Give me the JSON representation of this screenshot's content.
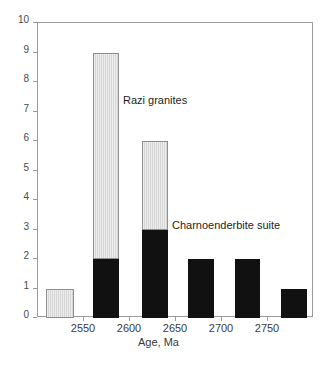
{
  "chart_data": {
    "type": "bar",
    "title": "",
    "subtitle": "",
    "xlabel": "Age, Ma",
    "ylabel": "",
    "xlim": [
      2500,
      2800
    ],
    "ylim": [
      0,
      10
    ],
    "grid": false,
    "legend_position": "none",
    "stacked": true,
    "x_ticks": [
      2550,
      2600,
      2650,
      2700,
      2750
    ],
    "x_tick_labels": [
      "2550",
      "2600",
      "2650",
      "2700",
      "2750"
    ],
    "y_ticks": [
      0,
      1,
      2,
      3,
      4,
      5,
      6,
      7,
      8,
      9,
      10
    ],
    "y_tick_labels": [
      "0",
      "1",
      "2",
      "3",
      "4",
      "5",
      "6",
      "7",
      "8",
      "9",
      "10"
    ],
    "bin_width": 25,
    "categories": [
      "2525",
      "2575",
      "2625",
      "2675",
      "2725",
      "2775"
    ],
    "series": [
      {
        "name": "Charnoenderbite suite",
        "color": "#111111",
        "values": [
          0,
          2,
          3,
          2,
          2,
          1
        ]
      },
      {
        "name": "Razi granites",
        "color": "#d6d6d6",
        "values": [
          1,
          7,
          3,
          0,
          0,
          0
        ]
      }
    ],
    "totals": [
      1,
      9,
      6,
      2,
      2,
      1
    ],
    "annotations": [
      {
        "text": "Razi granites",
        "x": 2585,
        "y": 7.6
      },
      {
        "text": "Charnoenderbite suite",
        "x": 2678,
        "y": 3.35
      }
    ],
    "bars": [
      {
        "center": 2525,
        "left_px": 45,
        "width_px": 28,
        "dark": 0,
        "light": 1,
        "total": 1
      },
      {
        "center": 2575,
        "left_px": 92,
        "width_px": 26,
        "dark": 2,
        "light": 7,
        "total": 9
      },
      {
        "center": 2625,
        "left_px": 141,
        "width_px": 26,
        "dark": 3,
        "light": 3,
        "total": 6
      },
      {
        "center": 2675,
        "left_px": 187,
        "width_px": 26,
        "dark": 2,
        "light": 0,
        "total": 2
      },
      {
        "center": 2725,
        "left_px": 234,
        "width_px": 25,
        "dark": 2,
        "light": 0,
        "total": 2
      },
      {
        "center": 2775,
        "left_px": 280,
        "width_px": 26,
        "dark": 1,
        "light": 0,
        "total": 1
      }
    ]
  }
}
